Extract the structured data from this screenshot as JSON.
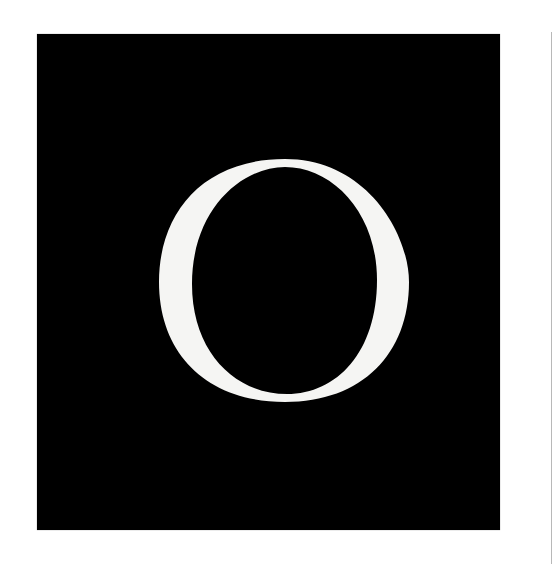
{
  "image": {
    "letter": "O",
    "panel_color": "#000000",
    "letter_color": "#f5f5f3",
    "background_color": "#ffffff",
    "rule_color": "#b8b8b8"
  }
}
